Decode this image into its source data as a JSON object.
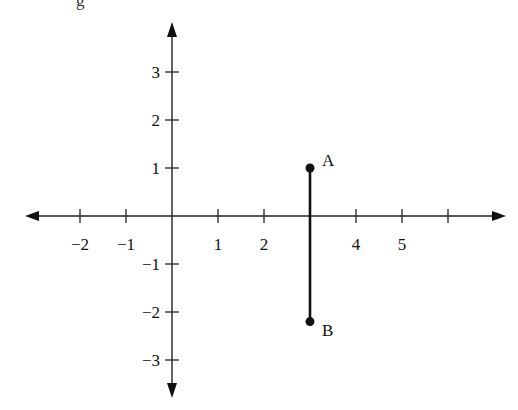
{
  "caption_fragment": "g",
  "chart_data": {
    "type": "scatter",
    "title": "",
    "xlabel": "",
    "ylabel": "",
    "grid": false,
    "xlim": [
      -3,
      7
    ],
    "ylim": [
      -4,
      4
    ],
    "x_ticks": [
      -2,
      -1,
      1,
      2,
      3,
      4,
      5,
      6
    ],
    "x_tick_labels": [
      "−2",
      "−1",
      "1",
      "2",
      "",
      "4",
      "5",
      ""
    ],
    "y_ticks": [
      3,
      2,
      1,
      -1,
      -2,
      -3
    ],
    "y_tick_labels": [
      "3",
      "2",
      "1",
      "−1",
      "−2",
      "−3"
    ],
    "points": [
      {
        "label": "A",
        "x": 3,
        "y": 1
      },
      {
        "label": "B",
        "x": 3,
        "y": -2.2
      }
    ],
    "segments": [
      {
        "from": "A",
        "to": "B"
      }
    ]
  },
  "layout": {
    "origin_px": [
      172,
      216
    ],
    "unit_x_px": 46,
    "unit_y_px": 48,
    "x_axis_span_px": [
      25,
      506
    ],
    "y_axis_span_px": [
      22,
      398
    ]
  }
}
